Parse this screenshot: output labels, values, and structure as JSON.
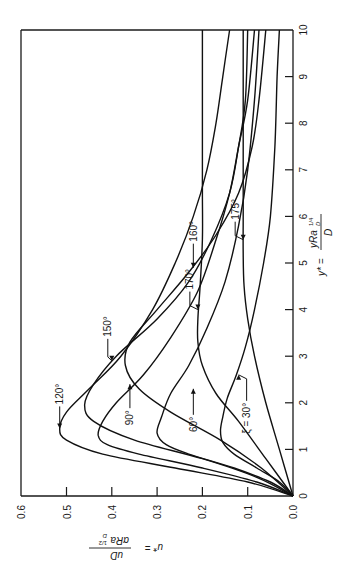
{
  "chart_data": {
    "type": "line",
    "orientation": "rotated-90-ccw",
    "title": "",
    "xlabel": "y* = yRa_D^(1/4) / D",
    "ylabel": "u* = uD / (αRa_D^(1/2))",
    "xlim": [
      0,
      10
    ],
    "ylim": [
      0,
      0.6
    ],
    "x_ticks": [
      0,
      1,
      2,
      3,
      4,
      5,
      6,
      7,
      8,
      9,
      10
    ],
    "x_tick_labels": [
      "0",
      "1",
      "2",
      "3",
      "4",
      "5",
      "6",
      "7",
      "8",
      "9",
      "10"
    ],
    "y_ticks": [
      0.0,
      0.1,
      0.2,
      0.3,
      0.4,
      0.5,
      0.6
    ],
    "y_tick_labels": [
      "0.0",
      "0.1",
      "0.2",
      "0.3",
      "0.4",
      "0.5",
      "0.6"
    ],
    "grid": false,
    "legend": "inline labels with arrows",
    "series": [
      {
        "name": "120°",
        "x": [
          0,
          0.3,
          0.6,
          0.9,
          1.2,
          1.45,
          1.8,
          2.3,
          3,
          4,
          5,
          6,
          7,
          8,
          9,
          10
        ],
        "values": [
          0,
          0.1,
          0.26,
          0.42,
          0.5,
          0.515,
          0.5,
          0.45,
          0.38,
          0.31,
          0.26,
          0.22,
          0.19,
          0.17,
          0.155,
          0.14
        ]
      },
      {
        "name": "150°",
        "x": [
          0,
          0.4,
          0.8,
          1.2,
          1.6,
          1.95,
          2.4,
          3,
          3.8,
          4.6,
          5.5,
          6.5,
          7.5,
          8.5,
          10
        ],
        "values": [
          0,
          0.08,
          0.2,
          0.35,
          0.44,
          0.46,
          0.44,
          0.39,
          0.3,
          0.23,
          0.18,
          0.14,
          0.12,
          0.105,
          0.1
        ]
      },
      {
        "name": "90°",
        "x": [
          0,
          0.3,
          0.6,
          0.9,
          1.1,
          1.3,
          1.6,
          2,
          2.6,
          3.4,
          4.4,
          5.5,
          6.5,
          7.5,
          8.5,
          10
        ],
        "values": [
          0,
          0.08,
          0.2,
          0.34,
          0.41,
          0.43,
          0.42,
          0.39,
          0.33,
          0.27,
          0.21,
          0.17,
          0.14,
          0.12,
          0.1,
          0.085
        ]
      },
      {
        "name": "160°",
        "x": [
          0,
          0.6,
          1.2,
          1.8,
          2.3,
          2.8,
          3.3,
          4,
          4.8,
          5.6,
          6.5,
          7.5,
          8.5,
          10
        ],
        "values": [
          0,
          0.07,
          0.16,
          0.27,
          0.34,
          0.37,
          0.36,
          0.3,
          0.23,
          0.17,
          0.12,
          0.09,
          0.075,
          0.06
        ]
      },
      {
        "name": "60°",
        "x": [
          0,
          0.3,
          0.6,
          0.9,
          1.1,
          1.35,
          1.7,
          2.2,
          2.8,
          3.6,
          4.6,
          5.8,
          7,
          8.5,
          10
        ],
        "values": [
          0,
          0.05,
          0.13,
          0.23,
          0.28,
          0.3,
          0.29,
          0.27,
          0.23,
          0.19,
          0.15,
          0.12,
          0.1,
          0.085,
          0.075
        ]
      },
      {
        "name": "170°",
        "x": [
          0,
          0.8,
          1.6,
          2.2,
          2.8,
          3.3,
          3.8,
          4.5,
          5.5,
          6.5,
          7.5,
          8.5,
          10
        ],
        "values": [
          0,
          0.06,
          0.12,
          0.17,
          0.2,
          0.21,
          0.21,
          0.205,
          0.2,
          0.2,
          0.2,
          0.2,
          0.2
        ]
      },
      {
        "name": "175°",
        "x": [
          0,
          1,
          2,
          3,
          3.8,
          4.5,
          5.2,
          6,
          7,
          8,
          9,
          10
        ],
        "values": [
          0,
          0.03,
          0.06,
          0.085,
          0.1,
          0.108,
          0.11,
          0.11,
          0.11,
          0.11,
          0.11,
          0.11
        ]
      },
      {
        "name": "ξ = 30°",
        "x": [
          0,
          0.3,
          0.6,
          0.9,
          1.15,
          1.4,
          1.7,
          2.1,
          2.6,
          3.2,
          4,
          5,
          6,
          7.5,
          9,
          10
        ],
        "values": [
          0,
          0.03,
          0.08,
          0.13,
          0.155,
          0.16,
          0.155,
          0.145,
          0.125,
          0.105,
          0.085,
          0.065,
          0.05,
          0.04,
          0.035,
          0.03
        ]
      }
    ],
    "annotations": [
      {
        "text": "120°",
        "arrow_to": [
          1.45,
          0.515
        ]
      },
      {
        "text": "150°",
        "arrow_to": [
          2.9,
          0.4
        ]
      },
      {
        "text": "160°",
        "arrow_to": [
          4.9,
          0.22
        ]
      },
      {
        "text": "90°",
        "arrow_to": [
          2.4,
          0.36
        ]
      },
      {
        "text": "170°",
        "arrow_to": [
          4.0,
          0.21
        ]
      },
      {
        "text": "175°",
        "arrow_to": [
          5.5,
          0.11
        ]
      },
      {
        "text": "60°",
        "arrow_to": [
          2.3,
          0.22
        ]
      },
      {
        "text": "ξ = 30°",
        "arrow_to": [
          2.6,
          0.12
        ]
      }
    ]
  },
  "axes": {
    "u_axis_label": {
      "main": "u* =",
      "num": "uD",
      "den": "αRa",
      "den_sub": "D",
      "den_sup": "1/2"
    },
    "y_axis_label": {
      "main": "y* =",
      "num": "yRa",
      "num_sub": "D",
      "num_sup": "1/4",
      "den": "D"
    }
  },
  "labels": {
    "l120": "120°",
    "l150": "150°",
    "l160": "160°",
    "l90": "90°",
    "l170": "170°",
    "l175": "175°",
    "l60": "60°",
    "l30": "ξ = 30°"
  }
}
